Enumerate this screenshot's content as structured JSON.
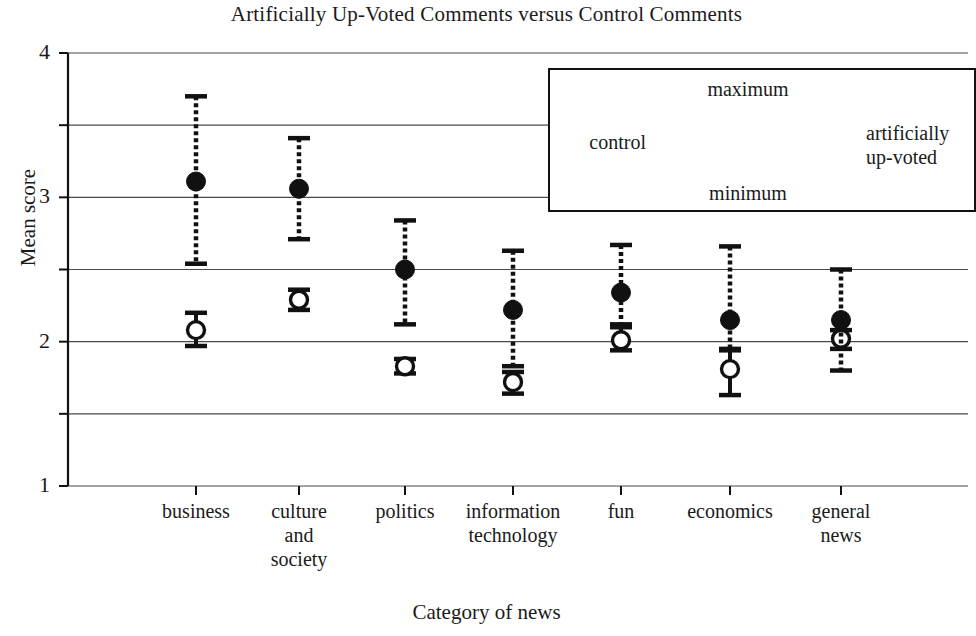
{
  "chart_data": {
    "type": "scatter",
    "title": "Artificially Up-Voted Comments versus Control Comments",
    "xlabel": "Category of news",
    "ylabel": "Mean score",
    "ylim": [
      1,
      4
    ],
    "yticks": [
      "1",
      "2",
      "3",
      "4"
    ],
    "gridlines": [
      1,
      1.5,
      2,
      2.5,
      3,
      3.5,
      4
    ],
    "grid": true,
    "legend_position": "inside-top-right",
    "categories": [
      "business",
      "culture and society",
      "politics",
      "information technology",
      "fun",
      "economics",
      "general news"
    ],
    "category_label_lines": [
      [
        "business"
      ],
      [
        "culture",
        "and",
        "society"
      ],
      [
        "politics"
      ],
      [
        "information",
        "technology"
      ],
      [
        "fun"
      ],
      [
        "economics"
      ],
      [
        "general",
        "news"
      ]
    ],
    "series": [
      {
        "name": "control",
        "marker": "open-circle",
        "errorbar_style": "solid",
        "values": [
          2.08,
          2.29,
          1.83,
          1.72,
          2.01,
          1.81,
          2.02
        ],
        "maximum": [
          2.2,
          2.36,
          1.88,
          1.79,
          2.1,
          1.95,
          2.08
        ],
        "minimum": [
          1.97,
          2.22,
          1.78,
          1.64,
          1.94,
          1.63,
          1.95
        ]
      },
      {
        "name": "artificially up-voted",
        "marker": "filled-circle",
        "errorbar_style": "dotted",
        "values": [
          3.11,
          3.06,
          2.5,
          2.22,
          2.34,
          2.15,
          2.15
        ],
        "maximum": [
          3.7,
          3.41,
          2.84,
          2.63,
          2.67,
          2.66,
          2.5
        ],
        "minimum": [
          2.54,
          2.71,
          2.12,
          1.83,
          2.12,
          1.94,
          1.8
        ]
      }
    ]
  },
  "legend": {
    "control_label": "control",
    "upvoted_label_line1": "artificially",
    "upvoted_label_line2": "up-voted",
    "maximum_label": "maximum",
    "minimum_label": "minimum"
  }
}
